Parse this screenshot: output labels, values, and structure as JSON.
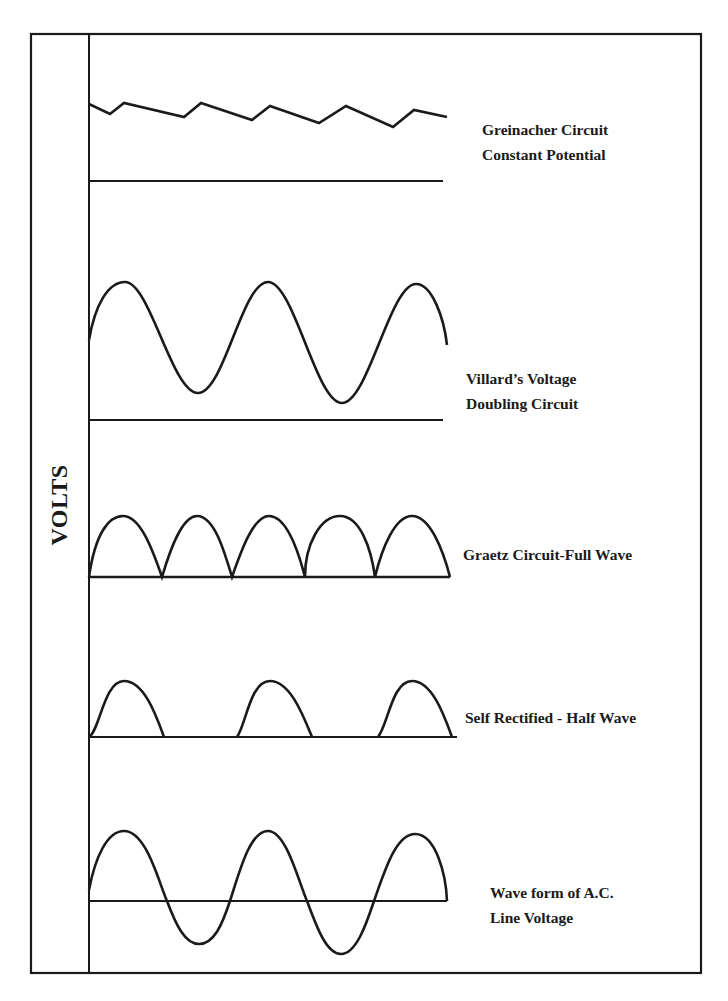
{
  "diagram": {
    "y_axis_label": "VOLTS",
    "colors": {
      "line": "#1a1a1a",
      "background": "#ffffff"
    },
    "panels": [
      {
        "id": "greinacher",
        "label_lines": [
          "Greinacher Circuit",
          "Constant Potential"
        ],
        "waveform": "sawtooth ripple above baseline"
      },
      {
        "id": "villard",
        "label_lines": [
          "Villard’s  Voltage",
          "Doubling Circuit"
        ],
        "waveform": "sine wave offset above baseline"
      },
      {
        "id": "graetz",
        "label_lines": [
          "Graetz Circuit-Full Wave"
        ],
        "waveform": "full-wave rectified (5 arches)"
      },
      {
        "id": "self-rectified",
        "label_lines": [
          "Self Rectified - Half Wave"
        ],
        "waveform": "half-wave rectified (3 arches)"
      },
      {
        "id": "ac-line",
        "label_lines": [
          "Wave form of A.C.",
          "Line Voltage"
        ],
        "waveform": "sine wave centered on axis"
      }
    ]
  }
}
